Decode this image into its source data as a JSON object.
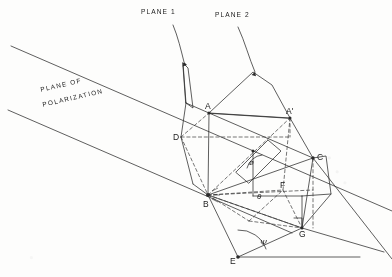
{
  "figure": {
    "background_color": "#fdfdfc",
    "ink_color": "#2a2a2a",
    "width": 392,
    "height": 277
  },
  "annotations": {
    "plane1_label": "PLANE 1",
    "plane2_label": "PLANE 2",
    "polarization_line1": "PLANE  OF",
    "polarization_line2": "POLARIZATION"
  },
  "points": [
    {
      "id": "A",
      "label": "A",
      "x": 209,
      "y": 113,
      "lx": 205,
      "ly": 104
    },
    {
      "id": "Aprime",
      "label": "A'",
      "x": 290,
      "y": 118,
      "lx": 286,
      "ly": 109
    },
    {
      "id": "B",
      "label": "B",
      "x": 208,
      "y": 195,
      "lx": 203,
      "ly": 205
    },
    {
      "id": "C",
      "label": "C",
      "x": 313,
      "y": 158,
      "lx": 318,
      "ly": 155
    },
    {
      "id": "D",
      "label": "D",
      "x": 181,
      "y": 137,
      "lx": 174,
      "ly": 135
    },
    {
      "id": "E",
      "label": "E",
      "x": 238,
      "y": 257,
      "lx": 231,
      "ly": 257
    },
    {
      "id": "F",
      "label": "F",
      "x": 283,
      "y": 190,
      "lx": 281,
      "ly": 184
    },
    {
      "id": "G",
      "label": "G",
      "x": 302,
      "y": 228,
      "lx": 300,
      "ly": 234
    }
  ],
  "angles": [
    {
      "id": "phi",
      "symbol": "ø",
      "label": "phi",
      "lx": 251,
      "ly": 163
    },
    {
      "id": "theta",
      "symbol": "θ",
      "label": "theta",
      "lx": 258,
      "ly": 196
    },
    {
      "id": "psi",
      "symbol": "Ψ",
      "label": "psi",
      "lx": 262,
      "ly": 243
    }
  ],
  "polarization_band": {
    "upper_line": {
      "x1": 11,
      "y1": 46,
      "x2": 392,
      "y2": 211
    },
    "lower_line": {
      "x1": 8,
      "y1": 110,
      "x2": 290,
      "y2": 232
    }
  },
  "colors": {
    "ink": "#2a2a2a",
    "paper": "#fdfdfc",
    "dashed": "#3a3a3a"
  }
}
